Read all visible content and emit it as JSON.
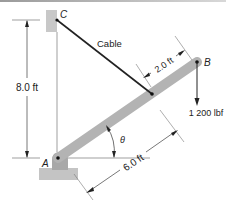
{
  "figure": {
    "points": {
      "A": "A",
      "B": "B",
      "C": "C"
    },
    "labels": {
      "cable": "Cable",
      "angle": "θ",
      "load": "1 200 lbf"
    },
    "dimensions": {
      "height_AC": "8.0 ft",
      "length_A_to_cable": "6.0 ft",
      "length_cable_to_B": "2.0 ft"
    },
    "colors": {
      "bar": "#b3b3b3",
      "wall": "#c8c8c8",
      "base": "#c4c4c4",
      "line": "#222222",
      "dim_line": "#555555"
    }
  }
}
